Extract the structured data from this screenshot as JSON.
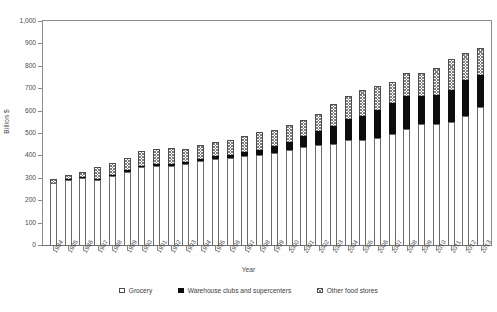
{
  "chart_data": {
    "type": "bar",
    "stacked": true,
    "title": "",
    "xlabel": "Year",
    "ylabel": "Billion $",
    "ylim": [
      0,
      1000
    ],
    "ytick_step": 100,
    "ytick_labels": [
      "1,000",
      "900",
      "800",
      "700",
      "600",
      "500",
      "400",
      "300",
      "200",
      "100",
      "0"
    ],
    "ytick_values": [
      1000,
      900,
      800,
      700,
      600,
      500,
      400,
      300,
      200,
      100,
      0
    ],
    "grid": false,
    "legend_position": "bottom",
    "categories": [
      "1984",
      "1985",
      "1986",
      "1987",
      "1988",
      "1989",
      "1990",
      "1991",
      "1992",
      "1993",
      "1994",
      "1995",
      "1996",
      "1997",
      "1998",
      "1999",
      "2000",
      "2001",
      "2002",
      "2003",
      "2004",
      "2005",
      "2006",
      "2007",
      "2008",
      "2009",
      "2010",
      "2011",
      "2012",
      "2013"
    ],
    "series": [
      {
        "name": "Grocery",
        "color": "#ffffff",
        "pattern": "solid-white",
        "values": [
          278,
          291,
          299,
          291,
          307,
          327,
          347,
          352,
          353,
          360,
          374,
          383,
          388,
          396,
          402,
          410,
          422,
          437,
          447,
          453,
          468,
          470,
          477,
          495,
          518,
          541,
          541,
          551,
          578,
          615
        ]
      },
      {
        "name": "Warehouse clubs and supercenters",
        "color": "#0d0d0d",
        "pattern": "solid-black",
        "values": [
          1,
          2,
          3,
          5,
          6,
          7,
          8,
          9,
          10,
          11,
          12,
          14,
          16,
          19,
          23,
          30,
          38,
          50,
          62,
          78,
          93,
          108,
          126,
          141,
          146,
          126,
          128,
          141,
          159,
          146
        ]
      },
      {
        "name": "Other food stores",
        "color": "#ffffff",
        "pattern": "crosshatch",
        "values": [
          16,
          19,
          24,
          53,
          54,
          56,
          65,
          68,
          68,
          59,
          59,
          62,
          67,
          70,
          78,
          74,
          78,
          70,
          78,
          97,
          104,
          116,
          107,
          94,
          106,
          103,
          121,
          137,
          121,
          119
        ]
      }
    ],
    "totals": [
      295,
      312,
      326,
      349,
      367,
      390,
      420,
      429,
      431,
      430,
      445,
      459,
      471,
      485,
      503,
      514,
      538,
      557,
      587,
      628,
      665,
      694,
      710,
      730,
      770,
      770,
      790,
      829,
      858,
      880
    ]
  },
  "legend": {
    "items": [
      {
        "label": "Grocery",
        "swatch": "empty-square-icon"
      },
      {
        "label": "Warehouse clubs and supercenters",
        "swatch": "filled-square-icon"
      },
      {
        "label": "Other food stores",
        "swatch": "hatched-square-icon"
      }
    ]
  }
}
